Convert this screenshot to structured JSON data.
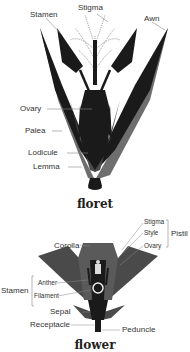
{
  "floret": {
    "caption": "floret",
    "labels": {
      "stamen": "Stamen",
      "stigma": "Stigma",
      "awn": "Awn",
      "ovary": "Ovary",
      "palea": "Palea",
      "lodicule": "Lodicule",
      "lemma": "Lemma"
    }
  },
  "flower": {
    "caption": "flower",
    "labels": {
      "stigma": "Stigma",
      "style": "Style",
      "ovary": "Ovary",
      "pistil": "Pistil",
      "corolla": "Corolla",
      "stamen": "Stamen",
      "anther": "Anther",
      "filament": "Filament",
      "sepal": "Sepal",
      "receptacle": "Receptacle",
      "peduncle": "Peduncle"
    }
  },
  "colors": {
    "dark": "#1a1a1a",
    "mid": "#4a4a4a",
    "gray": "#6e6e6e",
    "leader": "#888888"
  }
}
